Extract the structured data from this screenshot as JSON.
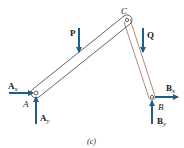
{
  "diagram": {
    "caption": "(c)",
    "colors": {
      "arrow": "#1f5f87",
      "member": "#222222",
      "label": "#1a1a1a"
    },
    "points": {
      "A": {
        "label": "A",
        "x": 36,
        "y": 93
      },
      "B": {
        "label": "B",
        "x": 152,
        "y": 97
      },
      "C": {
        "label": "C",
        "x": 127,
        "y": 20
      }
    },
    "members": [
      {
        "name": "AC",
        "from": "A",
        "to": "C"
      },
      {
        "name": "CB",
        "from": "C",
        "to": "B"
      }
    ],
    "forces": {
      "P": {
        "label": "P",
        "direction": "down"
      },
      "Q": {
        "label": "Q",
        "direction": "down"
      },
      "Ax": {
        "main": "A",
        "sub": "x",
        "direction": "right"
      },
      "Ay": {
        "main": "A",
        "sub": "y",
        "direction": "up"
      },
      "Bx": {
        "main": "B",
        "sub": "x",
        "direction": "right"
      },
      "By": {
        "main": "B",
        "sub": "y",
        "direction": "up"
      }
    }
  }
}
